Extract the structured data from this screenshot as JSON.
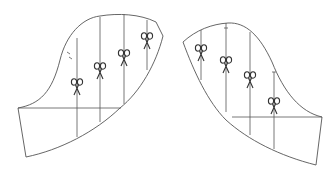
{
  "diagram": {
    "colors": {
      "line": "#555555",
      "scissors": "#333333",
      "background": "#ffffff"
    },
    "pieces": [
      {
        "id": "left-sleeve-piece",
        "cut_lines": [
          {
            "x": 77,
            "scissor_y": 82
          },
          {
            "x": 100,
            "scissor_y": 68
          },
          {
            "x": 124,
            "scissor_y": 57
          },
          {
            "x": 147,
            "scissor_y": 40
          }
        ],
        "icon": "scissors-icon"
      },
      {
        "id": "right-sleeve-piece",
        "cut_lines": [
          {
            "x": 201,
            "scissor_y": 52
          },
          {
            "x": 226,
            "scissor_y": 63
          },
          {
            "x": 250,
            "scissor_y": 78
          },
          {
            "x": 274,
            "scissor_y": 104
          }
        ],
        "icon": "scissors-icon"
      }
    ]
  }
}
